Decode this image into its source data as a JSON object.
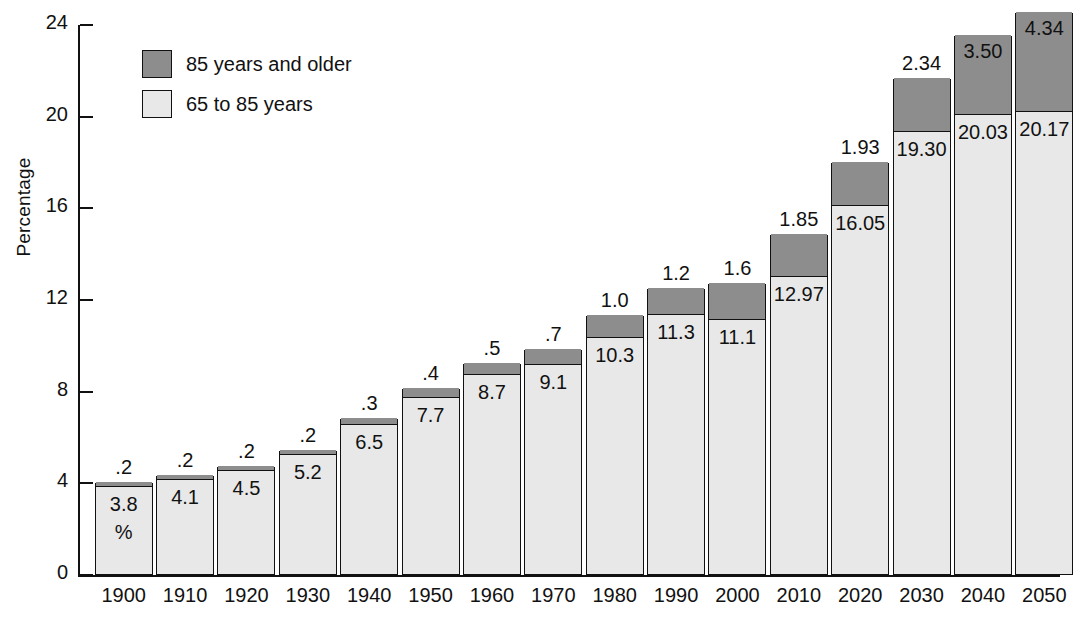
{
  "chart_data": {
    "type": "bar",
    "subtype": "stacked-vertical",
    "title": "",
    "subtitle": "",
    "xlabel": "",
    "ylabel": "Percentage",
    "ylim": [
      0,
      24
    ],
    "ytick_values": [
      0,
      4,
      8,
      12,
      16,
      20,
      24
    ],
    "ytick_labels": [
      "0",
      "4",
      "8",
      "12",
      "16",
      "20",
      "24"
    ],
    "grid": false,
    "legend_position": "upper-left-inside",
    "categories": [
      "1900",
      "1910",
      "1920",
      "1930",
      "1940",
      "1950",
      "1960",
      "1970",
      "1980",
      "1990",
      "2000",
      "2010",
      "2020",
      "2030",
      "2040",
      "2050"
    ],
    "series": [
      {
        "name": "65 to 85 years",
        "color": "#e8e8e8",
        "values": [
          3.8,
          4.1,
          4.5,
          5.2,
          6.5,
          7.7,
          8.7,
          9.1,
          10.3,
          11.3,
          11.1,
          12.97,
          16.05,
          19.3,
          20.03,
          20.17
        ],
        "value_labels": [
          "3.8",
          "4.1",
          "4.5",
          "5.2",
          "6.5",
          "7.7",
          "8.7",
          "9.1",
          "10.3",
          "11.3",
          "11.1",
          "12.97",
          "16.05",
          "19.30",
          "20.03",
          "20.17"
        ]
      },
      {
        "name": "85 years and older",
        "color": "#8d8d8d",
        "values": [
          0.2,
          0.2,
          0.2,
          0.2,
          0.3,
          0.4,
          0.5,
          0.7,
          1.0,
          1.2,
          1.6,
          1.85,
          1.93,
          2.34,
          3.5,
          4.34
        ],
        "value_labels": [
          ".2",
          ".2",
          ".2",
          ".2",
          ".3",
          ".4",
          ".5",
          ".7",
          "1.0",
          "1.2",
          "1.6",
          "1.85",
          "1.93",
          "2.34",
          "3.50",
          "4.34"
        ]
      }
    ],
    "annotations": [
      {
        "text": "%",
        "attached_to": "1900",
        "note": "percent sign under the 3.8 value inside the first bar"
      }
    ],
    "upper_label_placement": [
      "above",
      "above",
      "above",
      "above",
      "above",
      "above",
      "above",
      "above",
      "above",
      "above",
      "above",
      "above",
      "above",
      "above",
      "inside",
      "inside"
    ]
  },
  "legend": {
    "entries": [
      {
        "label": "85 years and older",
        "swatch": "dark"
      },
      {
        "label": "65 to 85 years",
        "swatch": "light"
      }
    ]
  },
  "axes": {
    "y_title": "Percentage"
  },
  "colors": {
    "segment_upper": "#8d8d8d",
    "segment_lower": "#e8e8e8",
    "outline": "#111111",
    "background": "#ffffff"
  }
}
